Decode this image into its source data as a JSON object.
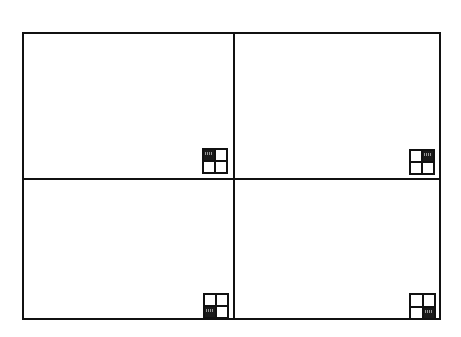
{
  "diagram": {
    "title": "Quadrant Orientation Diagram",
    "background_color": "#ffffff",
    "line_color": "#111111",
    "fill_color": "#1a1a1a",
    "frame": {
      "x": 22,
      "y": 32,
      "width": 419,
      "height": 288,
      "stroke_width": 2
    },
    "dividers": [
      {
        "orientation": "vertical",
        "position": 233,
        "stroke_width": 2
      },
      {
        "orientation": "horizontal",
        "position": 178,
        "stroke_width": 2
      }
    ],
    "quadrants": [
      {
        "id": "top-left",
        "label": "Top Left",
        "x": 24,
        "y": 34,
        "width": 209,
        "height": 144,
        "marker": {
          "x": 202,
          "y": 148,
          "size": 26,
          "filled_cell": "top-left",
          "cells": [
            {
              "position": "top-left",
              "filled": true
            },
            {
              "position": "top-right",
              "filled": false
            },
            {
              "position": "bottom-left",
              "filled": false
            },
            {
              "position": "bottom-right",
              "filled": false
            }
          ]
        }
      },
      {
        "id": "top-right",
        "label": "Top Right",
        "x": 233,
        "y": 34,
        "width": 208,
        "height": 144,
        "marker": {
          "x": 409,
          "y": 149,
          "size": 26,
          "filled_cell": "top-right",
          "cells": [
            {
              "position": "top-left",
              "filled": false
            },
            {
              "position": "top-right",
              "filled": true
            },
            {
              "position": "bottom-left",
              "filled": false
            },
            {
              "position": "bottom-right",
              "filled": false
            }
          ]
        }
      },
      {
        "id": "bottom-left",
        "label": "Bottom Left",
        "x": 24,
        "y": 178,
        "width": 209,
        "height": 142,
        "marker": {
          "x": 203,
          "y": 293,
          "size": 26,
          "filled_cell": "bottom-left",
          "cells": [
            {
              "position": "top-left",
              "filled": false
            },
            {
              "position": "top-right",
              "filled": false
            },
            {
              "position": "bottom-left",
              "filled": true
            },
            {
              "position": "bottom-right",
              "filled": false
            }
          ]
        }
      },
      {
        "id": "bottom-right",
        "label": "Bottom Right",
        "x": 233,
        "y": 178,
        "width": 208,
        "height": 142,
        "marker": {
          "x": 409,
          "y": 293,
          "size": 27,
          "filled_cell": "bottom-right",
          "cells": [
            {
              "position": "top-left",
              "filled": false
            },
            {
              "position": "top-right",
              "filled": false
            },
            {
              "position": "bottom-left",
              "filled": false
            },
            {
              "position": "bottom-right",
              "filled": true
            }
          ]
        }
      }
    ]
  }
}
